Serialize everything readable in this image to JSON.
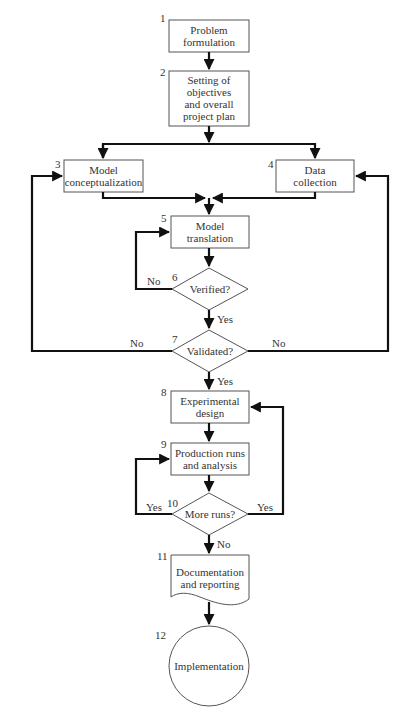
{
  "diagram": {
    "type": "flowchart",
    "title": "",
    "nodes": [
      {
        "id": 1,
        "number": "1",
        "shape": "process",
        "label": [
          "Problem",
          "formulation"
        ]
      },
      {
        "id": 2,
        "number": "2",
        "shape": "process",
        "label": [
          "Setting of",
          "objectives",
          "and overall",
          "project plan"
        ]
      },
      {
        "id": 3,
        "number": "3",
        "shape": "process",
        "label": [
          "Model",
          "conceptualization"
        ]
      },
      {
        "id": 4,
        "number": "4",
        "shape": "process",
        "label": [
          "Data",
          "collection"
        ]
      },
      {
        "id": 5,
        "number": "5",
        "shape": "process",
        "label": [
          "Model",
          "translation"
        ]
      },
      {
        "id": 6,
        "number": "6",
        "shape": "decision",
        "label": [
          "Verified?"
        ]
      },
      {
        "id": 7,
        "number": "7",
        "shape": "decision",
        "label": [
          "Validated?"
        ]
      },
      {
        "id": 8,
        "number": "8",
        "shape": "process",
        "label": [
          "Experimental",
          "design"
        ]
      },
      {
        "id": 9,
        "number": "9",
        "shape": "process",
        "label": [
          "Production runs",
          "and analysis"
        ]
      },
      {
        "id": 10,
        "number": "10",
        "shape": "decision",
        "label": [
          "More runs?"
        ]
      },
      {
        "id": 11,
        "number": "11",
        "shape": "document",
        "label": [
          "Documentation",
          "and reporting"
        ]
      },
      {
        "id": 12,
        "number": "12",
        "shape": "terminal-circle",
        "label": [
          "Implementation"
        ]
      }
    ],
    "edges": [
      {
        "from": 1,
        "to": 2,
        "label": ""
      },
      {
        "from": 2,
        "to": 3,
        "label": ""
      },
      {
        "from": 2,
        "to": 4,
        "label": ""
      },
      {
        "from": 3,
        "to": 5,
        "label": ""
      },
      {
        "from": 4,
        "to": 5,
        "label": ""
      },
      {
        "from": 5,
        "to": 6,
        "label": ""
      },
      {
        "from": 6,
        "to": 5,
        "label": "No"
      },
      {
        "from": 6,
        "to": 7,
        "label": "Yes"
      },
      {
        "from": 7,
        "to": 3,
        "label": "No"
      },
      {
        "from": 7,
        "to": 4,
        "label": "No"
      },
      {
        "from": 7,
        "to": 8,
        "label": "Yes"
      },
      {
        "from": 8,
        "to": 9,
        "label": ""
      },
      {
        "from": 9,
        "to": 10,
        "label": ""
      },
      {
        "from": 10,
        "to": 9,
        "label": "Yes"
      },
      {
        "from": 10,
        "to": 8,
        "label": "Yes"
      },
      {
        "from": 10,
        "to": 11,
        "label": "No"
      },
      {
        "from": 11,
        "to": 12,
        "label": ""
      }
    ],
    "edge_labels": {
      "no": "No",
      "yes": "Yes"
    }
  }
}
